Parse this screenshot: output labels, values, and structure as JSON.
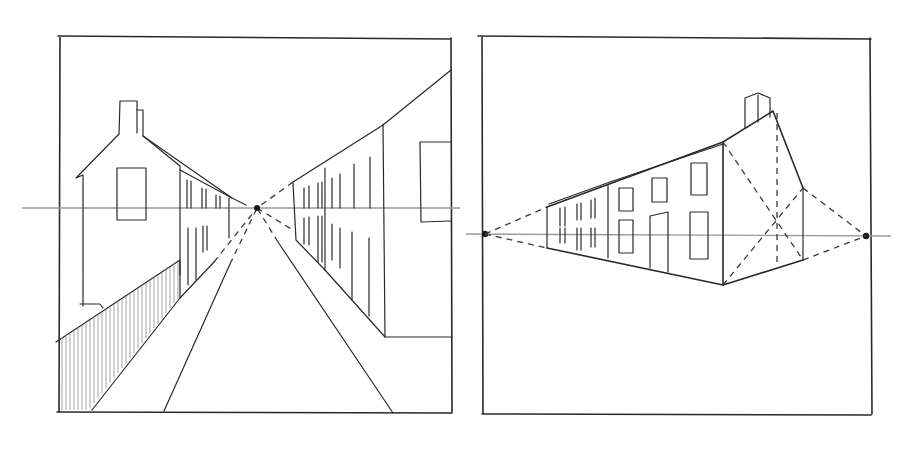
{
  "figure": {
    "panels": [
      {
        "id": "one-point-perspective",
        "subject": "street with gable-end house, fence and row houses converging to a single vanishing point",
        "horizon_y": 208,
        "vanishing_points": [
          [
            257,
            208
          ]
        ]
      },
      {
        "id": "two-point-perspective",
        "subject": "terrace of houses with chimney drawn with two vanishing points on the horizon",
        "horizon_y": 235,
        "vanishing_points": [
          [
            485,
            234
          ],
          [
            866,
            236
          ]
        ]
      }
    ],
    "colors": {
      "paper": "#ffffff",
      "pencil": "#2a2a2a",
      "horizon": "#9a9a9a"
    }
  }
}
